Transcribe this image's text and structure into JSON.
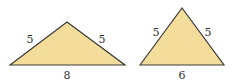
{
  "diagram": {
    "fill_color": "#f4dc9a",
    "stroke_color": "#3a3a3a",
    "triangles": [
      {
        "name": "obtuse-isosceles",
        "points": "10,65 67,22 125,65",
        "sides": {
          "left": "5",
          "right": "5",
          "base": "8"
        }
      },
      {
        "name": "acute-isosceles",
        "points": "140,65 182,8 224,65",
        "sides": {
          "left": "5",
          "right": "5",
          "base": "6"
        }
      }
    ]
  }
}
